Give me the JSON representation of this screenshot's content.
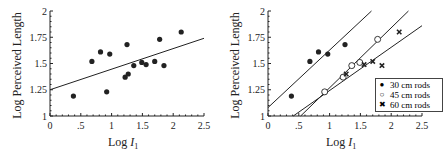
{
  "chart_data": [
    {
      "type": "scatter",
      "title": "",
      "xlabel": "Log I1",
      "ylabel": "Log Perceived Length",
      "xlim": [
        0,
        2.5
      ],
      "ylim": [
        1,
        2
      ],
      "xticks": [
        "0",
        ".5",
        "1",
        "1.5",
        "2",
        "2.5"
      ],
      "yticks": [
        "1",
        "1.25",
        "1.5",
        "1.75",
        "2"
      ],
      "grid": false,
      "series": [
        {
          "name": "all rods",
          "marker": "filled-circle",
          "points": [
            [
              0.38,
              1.19
            ],
            [
              0.68,
              1.52
            ],
            [
              0.82,
              1.61
            ],
            [
              0.92,
              1.23
            ],
            [
              0.97,
              1.59
            ],
            [
              1.22,
              1.37
            ],
            [
              1.25,
              1.68
            ],
            [
              1.27,
              1.4
            ],
            [
              1.36,
              1.48
            ],
            [
              1.49,
              1.51
            ],
            [
              1.56,
              1.49
            ],
            [
              1.7,
              1.52
            ],
            [
              1.78,
              1.73
            ],
            [
              1.85,
              1.48
            ],
            [
              2.13,
              1.8
            ]
          ]
        }
      ],
      "fit_lines": [
        {
          "name": "overall fit",
          "x": [
            0,
            2.5
          ],
          "y": [
            1.25,
            1.74
          ]
        }
      ]
    },
    {
      "type": "scatter",
      "title": "",
      "xlabel": "Log I1",
      "ylabel": "Log Perceived Length",
      "xlim": [
        0,
        2.5
      ],
      "ylim": [
        1,
        2
      ],
      "xticks": [
        "0",
        ".5",
        "1",
        "1.5",
        "2",
        "2.5"
      ],
      "yticks": [
        "1",
        "1.25",
        "1.5",
        "1.75",
        "2"
      ],
      "grid": false,
      "legend_position": "lower right",
      "series": [
        {
          "name": "30 cm rods",
          "marker": "filled-circle",
          "points": [
            [
              0.38,
              1.19
            ],
            [
              0.68,
              1.52
            ],
            [
              0.82,
              1.61
            ],
            [
              0.97,
              1.59
            ],
            [
              1.25,
              1.68
            ]
          ]
        },
        {
          "name": "45 cm rods",
          "marker": "open-circle",
          "points": [
            [
              0.92,
              1.23
            ],
            [
              1.22,
              1.37
            ],
            [
              1.36,
              1.48
            ],
            [
              1.49,
              1.51
            ],
            [
              1.78,
              1.73
            ]
          ]
        },
        {
          "name": "60 cm rods",
          "marker": "x",
          "points": [
            [
              1.27,
              1.4
            ],
            [
              1.56,
              1.49
            ],
            [
              1.7,
              1.52
            ],
            [
              1.85,
              1.48
            ],
            [
              2.13,
              1.8
            ]
          ]
        }
      ],
      "fit_lines": [
        {
          "name": "30 cm fit",
          "x": [
            0,
            1.68
          ],
          "y": [
            1.08,
            2.0
          ]
        },
        {
          "name": "45 cm fit",
          "x": [
            0.53,
            2.28
          ],
          "y": [
            1.0,
            2.0
          ]
        },
        {
          "name": "60 cm fit",
          "x": [
            0.41,
            2.5
          ],
          "y": [
            1.0,
            1.86
          ]
        }
      ]
    }
  ],
  "left": {
    "ylabel": "Log Perceived Length",
    "xlabel_prefix": "Log ",
    "xlabel_var": "I",
    "xlabel_sub": "1"
  },
  "right": {
    "ylabel": "Log Perceived Length",
    "xlabel_prefix": "Log ",
    "xlabel_var": "I",
    "xlabel_sub": "1",
    "legend": [
      {
        "symbol": "●",
        "label": "30 cm rods"
      },
      {
        "symbol": "○",
        "label": "45 cm rods"
      },
      {
        "symbol": "✖",
        "label": "60 cm rods"
      }
    ]
  },
  "colors": {
    "ink": "#222222",
    "background": "#ffffff"
  }
}
